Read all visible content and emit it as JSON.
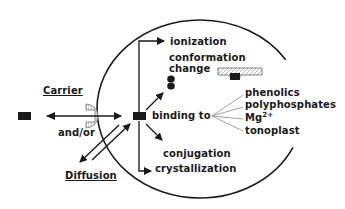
{
  "diagram": {
    "labels": {
      "carrier": "Carrier",
      "and_or": "and/or",
      "diffusion": "Diffusion",
      "ionization": "ionization",
      "conformation": "conformation",
      "change": "change",
      "binding_to": "binding to",
      "phenolics": "phenolics",
      "polyphosphates": "polyphosphates",
      "mg": "Mg",
      "mg_charge": "2+",
      "tonoplast": "tonoplast",
      "conjugation": "conjugation",
      "crystallization": "crystallization"
    },
    "colors": {
      "ink": "#1a1a1a",
      "background": "#ffffff",
      "hatch": "#888888"
    }
  }
}
